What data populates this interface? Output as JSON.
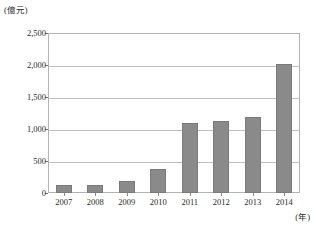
{
  "chart_data": {
    "type": "bar",
    "title": "",
    "xlabel": "(年)",
    "ylabel": "(億元)",
    "categories": [
      "2007",
      "2008",
      "2009",
      "2010",
      "2011",
      "2012",
      "2013",
      "2014"
    ],
    "values": [
      120,
      130,
      180,
      380,
      1090,
      1130,
      1190,
      2020
    ],
    "ylim": [
      0,
      2500
    ],
    "ytick_values": [
      0,
      500,
      1000,
      1500,
      2000,
      2500
    ],
    "ytick_labels": [
      "0",
      "500",
      "1,000",
      "1,500",
      "2,000",
      "2,500"
    ],
    "grid": true,
    "legend": "none",
    "bar_color": "#8a8a8a",
    "grid_color": "#bfbfbf",
    "frame_color": "#b3b3b3",
    "text_color": "#2b2b2b"
  }
}
